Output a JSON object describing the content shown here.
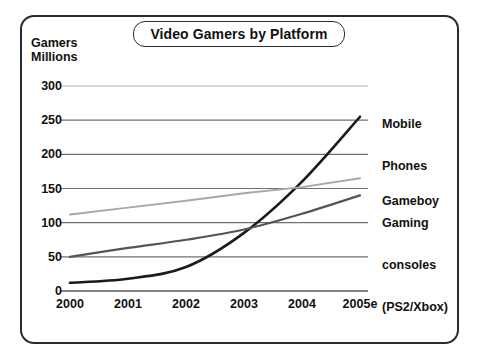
{
  "chart_data": {
    "type": "line",
    "title": "Video Gamers by Platform",
    "ylabel": "Gamers Millions",
    "xlabel": "",
    "x": [
      "2000",
      "2001",
      "2002",
      "2003",
      "2004",
      "2005e"
    ],
    "categories": [
      "2000",
      "2001",
      "2002",
      "2003",
      "2004",
      "2005e"
    ],
    "yticks": [
      "300",
      "250",
      "200",
      "150",
      "100",
      "50",
      "0"
    ],
    "ylim": [
      0,
      300
    ],
    "grid": true,
    "legend_position": "right-of-plot",
    "series": [
      {
        "name": "Mobile Phones",
        "values": [
          12,
          18,
          35,
          85,
          160,
          255
        ],
        "color": "#1a1a1a"
      },
      {
        "name": "Gameboy",
        "values": [
          112,
          122,
          132,
          143,
          152,
          165
        ],
        "color": "#a8a8a8"
      },
      {
        "name": "Gaming consoles (PS2/Xbox)",
        "values": [
          50,
          63,
          75,
          90,
          113,
          140
        ],
        "color": "#555555"
      }
    ],
    "series_labels": [
      {
        "line1": "Mobile",
        "line2": "Phones"
      },
      {
        "line1": "Gameboy"
      },
      {
        "line1": "Gaming",
        "line2": "consoles",
        "line3": "(PS2/Xbox)"
      }
    ]
  },
  "colors": {
    "frame": "#2b2b2b",
    "gridline": "#707070",
    "gridline_top": "#b5b5b5",
    "axis": "#707070",
    "text": "#111111",
    "background": "#ffffff"
  }
}
